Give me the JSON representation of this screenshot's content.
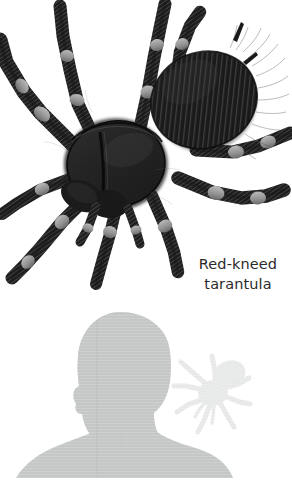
{
  "figure": {
    "background_color": "#ffffff",
    "width": 292,
    "height": 498
  },
  "illustration": {
    "name": "red-kneed-tarantula-illustration",
    "subject": "Red-kneed tarantula",
    "style": "black and white engraving",
    "ink_color": "#1c1c1c",
    "joint_color": "#8e8e8e",
    "leg_count": 8
  },
  "caption": {
    "line1": "Red-kneed",
    "line2": "tarantula",
    "text_color": "#2b2b2b",
    "font_size_px": 14.5,
    "align": "center"
  },
  "scale_comparison": {
    "name": "size-comparison-diagram",
    "human_silhouette": {
      "label": "human-head-and-shoulders-silhouette",
      "fill_color": "#c5c7c7"
    },
    "spider_silhouette": {
      "label": "tarantula-silhouette",
      "fill_color": "#e7e8e8"
    }
  }
}
